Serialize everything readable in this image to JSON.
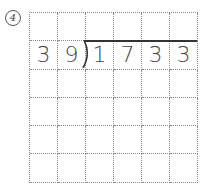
{
  "problem": {
    "number_label": "4",
    "divisor": [
      "3",
      "9"
    ],
    "dividend": [
      "1",
      "7",
      "3",
      "3"
    ],
    "grid": {
      "columns": 6,
      "rows": 6
    }
  }
}
